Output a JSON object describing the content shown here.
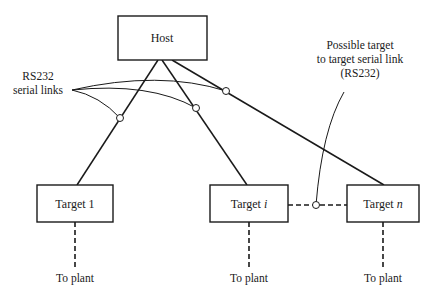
{
  "diagram": {
    "nodes": {
      "host": {
        "label": "Host"
      },
      "target1": {
        "label": "Target 1"
      },
      "targeti": {
        "label_prefix": "Target",
        "label_var": "i"
      },
      "targetn": {
        "label_prefix": "Target",
        "label_var": "n"
      }
    },
    "plant_labels": [
      "To plant",
      "To plant",
      "To plant"
    ],
    "annotations": {
      "serial_links": {
        "line1": "RS232",
        "line2": "serial links"
      },
      "possible_link": {
        "line1": "Possible target",
        "line2": "to target serial link",
        "line3": "(RS232)"
      }
    },
    "edges": [
      {
        "from": "host",
        "to": "target1",
        "type": "RS232 serial link"
      },
      {
        "from": "host",
        "to": "targeti",
        "type": "RS232 serial link"
      },
      {
        "from": "host",
        "to": "targetn",
        "type": "RS232 serial link"
      },
      {
        "from": "targeti",
        "to": "targetn",
        "type": "possible target-to-target serial link (dashed)"
      },
      {
        "from": "target1",
        "to": "plant",
        "type": "dashed"
      },
      {
        "from": "targeti",
        "to": "plant",
        "type": "dashed"
      },
      {
        "from": "targetn",
        "to": "plant",
        "type": "dashed"
      }
    ]
  }
}
